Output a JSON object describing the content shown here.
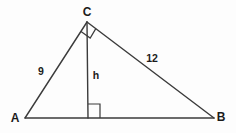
{
  "diagram": {
    "type": "geometry-right-triangle-with-altitude",
    "vertices": {
      "a": "A",
      "b": "B",
      "c": "C"
    },
    "side_labels": {
      "ac": "9",
      "cb": "12",
      "altitude": "h"
    },
    "right_angle_marks": [
      "at vertex C",
      "at foot of altitude on AB"
    ],
    "colors": {
      "line": "#3b3b3b",
      "text": "#1b1b1b",
      "background": "#fdfdfd"
    }
  }
}
